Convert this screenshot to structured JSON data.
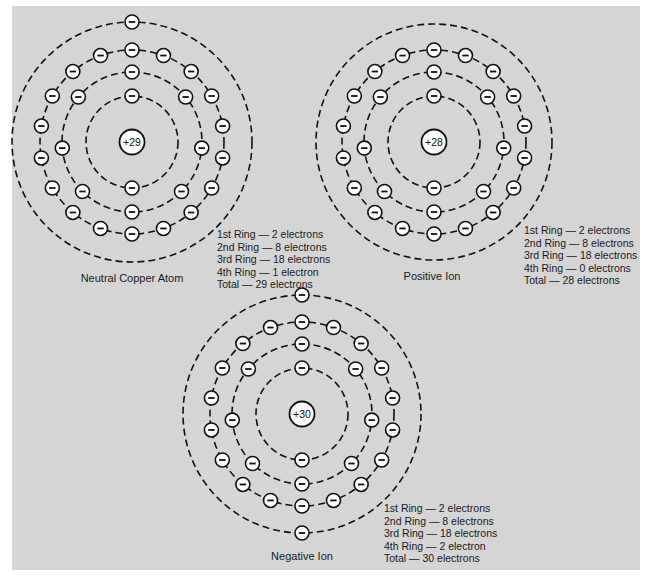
{
  "colors": {
    "background": "#ffffff",
    "panel": "#d5d5d5",
    "stroke": "#111111",
    "particle_fill": "#ffffff"
  },
  "atoms": [
    {
      "id": "neutral",
      "label": "Neutral Copper Atom",
      "nucleus_charge": "+29",
      "center": [
        132,
        142
      ],
      "rings": [
        {
          "radius": 46,
          "electrons": 2,
          "angles": [
            0,
            180
          ]
        },
        {
          "radius": 70,
          "electrons": 8,
          "angles": [
            0,
            50,
            95,
            135,
            180,
            225,
            265,
            310
          ]
        },
        {
          "radius": 92,
          "electrons": 18,
          "angles": [
            0,
            20,
            40,
            60,
            80,
            100,
            120,
            140,
            160,
            180,
            200,
            220,
            240,
            260,
            280,
            300,
            320,
            340
          ]
        },
        {
          "radius": 120,
          "electrons": 1,
          "angles": [
            0
          ]
        }
      ],
      "legend": [
        "1st Ring — 2 electrons",
        "2nd Ring — 8 electrons",
        "3rd Ring — 18 electrons",
        "4th Ring — 1 electron",
        "Total — 29 electrons"
      ]
    },
    {
      "id": "positive",
      "label": "Positive Ion",
      "nucleus_charge": "+28",
      "center": [
        434,
        142
      ],
      "rings": [
        {
          "radius": 46,
          "electrons": 2,
          "angles": [
            0,
            180
          ]
        },
        {
          "radius": 70,
          "electrons": 8,
          "angles": [
            0,
            50,
            95,
            135,
            180,
            225,
            265,
            310
          ]
        },
        {
          "radius": 92,
          "electrons": 18,
          "angles": [
            0,
            20,
            40,
            60,
            80,
            100,
            120,
            140,
            160,
            180,
            200,
            220,
            240,
            260,
            280,
            300,
            320,
            340
          ]
        },
        {
          "radius": 118,
          "electrons": 0,
          "angles": []
        }
      ],
      "legend": [
        "1st Ring — 2 electrons",
        "2nd Ring — 8 electrons",
        "3rd Ring — 18 electrons",
        "4th Ring — 0 electrons",
        "Total — 28 electrons"
      ]
    },
    {
      "id": "negative",
      "label": "Negative Ion",
      "nucleus_charge": "+30",
      "center": [
        302,
        414
      ],
      "rings": [
        {
          "radius": 46,
          "electrons": 2,
          "angles": [
            0,
            180
          ]
        },
        {
          "radius": 70,
          "electrons": 8,
          "angles": [
            0,
            50,
            95,
            135,
            180,
            225,
            265,
            310
          ]
        },
        {
          "radius": 92,
          "electrons": 18,
          "angles": [
            0,
            20,
            40,
            60,
            80,
            100,
            120,
            140,
            160,
            180,
            200,
            220,
            240,
            260,
            280,
            300,
            320,
            340
          ]
        },
        {
          "radius": 119,
          "electrons": 2,
          "angles": [
            0,
            180
          ]
        }
      ],
      "legend": [
        "1st Ring — 2 electrons",
        "2nd Ring — 8 electrons",
        "3rd Ring — 18 electrons",
        "4th Ring — 2 electron",
        "Total — 30 electrons"
      ]
    }
  ],
  "electron_symbol": "−"
}
